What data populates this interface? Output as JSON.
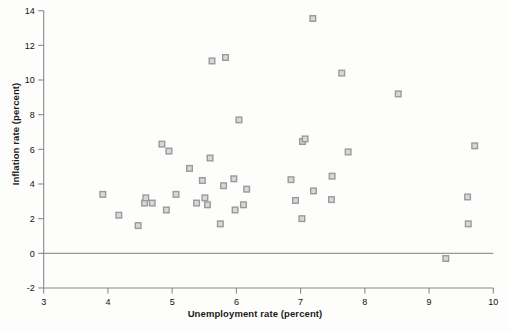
{
  "chart_data": {
    "type": "scatter",
    "title": "",
    "xlabel": "Unemployment rate (percent)",
    "ylabel": "Inflation rate (percent)",
    "xlim": [
      3,
      10
    ],
    "ylim": [
      -2,
      14
    ],
    "xticks": [
      3,
      4,
      5,
      6,
      7,
      8,
      9,
      10
    ],
    "xtick_labels": [
      "3",
      "4",
      "5",
      "6",
      "7",
      "8",
      "9",
      "10"
    ],
    "yticks": [
      -2,
      0,
      2,
      4,
      6,
      8,
      10,
      12,
      14
    ],
    "ytick_labels": [
      "-2",
      "0",
      "2",
      "4",
      "6",
      "8",
      "10",
      "12",
      "14"
    ],
    "grid": false,
    "legend": "none",
    "marker": {
      "shape": "square",
      "edge_color": "#9a9a9a",
      "face_color": "#d8d8d8",
      "size_px": 7
    },
    "zero_line": {
      "y": 0,
      "color": "#7d7d7d",
      "width_px": 1
    },
    "axis_color": "#8a8a8a",
    "points": [
      {
        "x": 3.92,
        "y": 3.4
      },
      {
        "x": 4.17,
        "y": 2.2
      },
      {
        "x": 4.47,
        "y": 1.6
      },
      {
        "x": 4.57,
        "y": 2.9
      },
      {
        "x": 4.59,
        "y": 3.2
      },
      {
        "x": 4.69,
        "y": 2.9
      },
      {
        "x": 4.84,
        "y": 6.3
      },
      {
        "x": 4.91,
        "y": 2.5
      },
      {
        "x": 4.95,
        "y": 5.9
      },
      {
        "x": 5.06,
        "y": 3.4
      },
      {
        "x": 5.27,
        "y": 4.9
      },
      {
        "x": 5.38,
        "y": 2.9
      },
      {
        "x": 5.47,
        "y": 4.2
      },
      {
        "x": 5.51,
        "y": 3.2
      },
      {
        "x": 5.55,
        "y": 2.8
      },
      {
        "x": 5.59,
        "y": 5.5
      },
      {
        "x": 5.62,
        "y": 11.1
      },
      {
        "x": 5.75,
        "y": 1.7
      },
      {
        "x": 5.8,
        "y": 3.9
      },
      {
        "x": 5.83,
        "y": 11.3
      },
      {
        "x": 5.96,
        "y": 4.3
      },
      {
        "x": 5.98,
        "y": 2.5
      },
      {
        "x": 6.04,
        "y": 7.7
      },
      {
        "x": 6.11,
        "y": 2.8
      },
      {
        "x": 6.16,
        "y": 3.7
      },
      {
        "x": 6.85,
        "y": 4.25
      },
      {
        "x": 6.92,
        "y": 3.05
      },
      {
        "x": 7.02,
        "y": 2.0
      },
      {
        "x": 7.03,
        "y": 6.45
      },
      {
        "x": 7.07,
        "y": 6.6
      },
      {
        "x": 7.19,
        "y": 13.55
      },
      {
        "x": 7.2,
        "y": 3.6
      },
      {
        "x": 7.48,
        "y": 3.1
      },
      {
        "x": 7.49,
        "y": 4.45
      },
      {
        "x": 7.64,
        "y": 10.4
      },
      {
        "x": 7.74,
        "y": 5.85
      },
      {
        "x": 8.52,
        "y": 9.2
      },
      {
        "x": 9.26,
        "y": -0.3
      },
      {
        "x": 9.61,
        "y": 1.7
      },
      {
        "x": 9.6,
        "y": 3.25
      },
      {
        "x": 9.71,
        "y": 6.2
      }
    ]
  }
}
